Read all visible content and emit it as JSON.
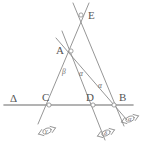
{
  "figure": {
    "background_color": "#ffffff",
    "line_color": "#8a8a8a",
    "label_color": "#555555",
    "width": 145,
    "height": 150
  },
  "points": [
    {
      "id": "E",
      "label": "E",
      "x": 81,
      "y": 15,
      "label_x": 88,
      "label_y": 10
    },
    {
      "id": "A",
      "label": "A",
      "x": 71,
      "y": 51,
      "label_x": 56,
      "label_y": 45
    },
    {
      "id": "C",
      "label": "C",
      "x": 49,
      "y": 105,
      "label_x": 42,
      "label_y": 92
    },
    {
      "id": "D",
      "label": "D",
      "x": 93,
      "y": 105,
      "label_x": 86,
      "label_y": 92
    },
    {
      "id": "B",
      "label": "B",
      "x": 114,
      "y": 105,
      "label_x": 119,
      "label_y": 92
    }
  ],
  "line_label": {
    "id": "Delta",
    "label": "Δ",
    "x": 10,
    "y": 93
  },
  "angle_labels": [
    {
      "id": "beta-at-A",
      "label": "β",
      "x": 62,
      "y": 68
    },
    {
      "id": "alpha-at-A",
      "label": "α",
      "x": 79,
      "y": 70
    },
    {
      "id": "alpha-at-B",
      "label": "α",
      "x": 98,
      "y": 82
    }
  ],
  "direction_markers": [
    {
      "id": "marker-gamma",
      "label": "γ",
      "x": 47,
      "y": 131,
      "angle": -20
    },
    {
      "id": "marker-delta",
      "label": "δ",
      "x": 106,
      "y": 133,
      "angle": -20
    },
    {
      "id": "marker-alpha",
      "label": "α",
      "x": 130,
      "y": 119,
      "angle": -20
    }
  ],
  "segments": [
    {
      "id": "line-E-through-C",
      "x1": 89,
      "y1": 3,
      "x2": 38,
      "y2": 124
    },
    {
      "id": "line-E-through-B",
      "x1": 73,
      "y1": 3,
      "x2": 124,
      "y2": 126
    },
    {
      "id": "line-A-to-D-ext",
      "x1": 62,
      "y1": 31,
      "x2": 105,
      "y2": 140
    },
    {
      "id": "line-A-to-B-ext",
      "x1": 56,
      "y1": 38,
      "x2": 127,
      "y2": 120
    },
    {
      "id": "line-base-Delta",
      "x1": 4,
      "y1": 105,
      "x2": 133,
      "y2": 105
    }
  ]
}
